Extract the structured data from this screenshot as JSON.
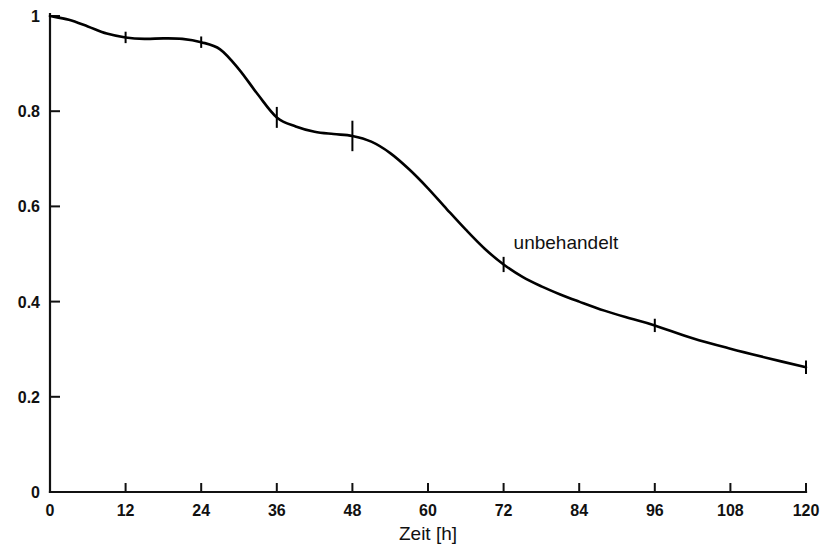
{
  "chart_data": {
    "type": "line",
    "title": "",
    "subtitle": "",
    "xlabel": "Zeit [h]",
    "ylabel": "",
    "xlim": [
      0,
      120
    ],
    "ylim": [
      0,
      1
    ],
    "grid": false,
    "legend_position": "inline-annotation",
    "x_ticks": [
      0,
      12,
      24,
      36,
      48,
      60,
      72,
      84,
      96,
      108,
      120
    ],
    "x_tick_labels": [
      "0",
      "12",
      "24",
      "36",
      "48",
      "60",
      "72",
      "84",
      "96",
      "108",
      "120"
    ],
    "y_ticks": [
      0,
      0.2,
      0.4,
      0.6,
      0.8,
      1
    ],
    "y_tick_labels": [
      "0",
      "0.2",
      "0.4",
      "0.6",
      "0.8",
      "1"
    ],
    "series": [
      {
        "name": "unbehandelt",
        "annotation": "unbehandelt",
        "annotation_x": 72,
        "annotation_y": 0.51,
        "color": "#000000",
        "x": [
          0,
          12,
          24,
          36,
          48,
          72,
          96,
          120
        ],
        "values": [
          1.0,
          0.955,
          0.945,
          0.787,
          0.748,
          0.478,
          0.35,
          0.262
        ],
        "errors": [
          0.0,
          0.012,
          0.012,
          0.022,
          0.032,
          0.016,
          0.014,
          0.014
        ],
        "curve_points": [
          [
            0,
            1.0
          ],
          [
            3,
            0.992
          ],
          [
            6,
            0.978
          ],
          [
            9,
            0.963
          ],
          [
            12,
            0.955
          ],
          [
            15,
            0.952
          ],
          [
            18,
            0.953
          ],
          [
            21,
            0.952
          ],
          [
            24,
            0.945
          ],
          [
            27,
            0.93
          ],
          [
            30,
            0.888
          ],
          [
            33,
            0.835
          ],
          [
            36,
            0.787
          ],
          [
            39,
            0.768
          ],
          [
            42,
            0.757
          ],
          [
            45,
            0.752
          ],
          [
            48,
            0.748
          ],
          [
            51,
            0.736
          ],
          [
            54,
            0.712
          ],
          [
            57,
            0.678
          ],
          [
            60,
            0.638
          ],
          [
            63,
            0.594
          ],
          [
            66,
            0.551
          ],
          [
            69,
            0.511
          ],
          [
            72,
            0.478
          ],
          [
            75,
            0.452
          ],
          [
            78,
            0.432
          ],
          [
            81,
            0.415
          ],
          [
            84,
            0.4
          ],
          [
            88,
            0.381
          ],
          [
            92,
            0.365
          ],
          [
            96,
            0.35
          ],
          [
            102,
            0.323
          ],
          [
            108,
            0.301
          ],
          [
            114,
            0.281
          ],
          [
            120,
            0.262
          ]
        ]
      }
    ]
  },
  "annotations": {
    "untreated_label": "unbehandelt"
  },
  "axis": {
    "x_title": "Zeit [h]"
  }
}
